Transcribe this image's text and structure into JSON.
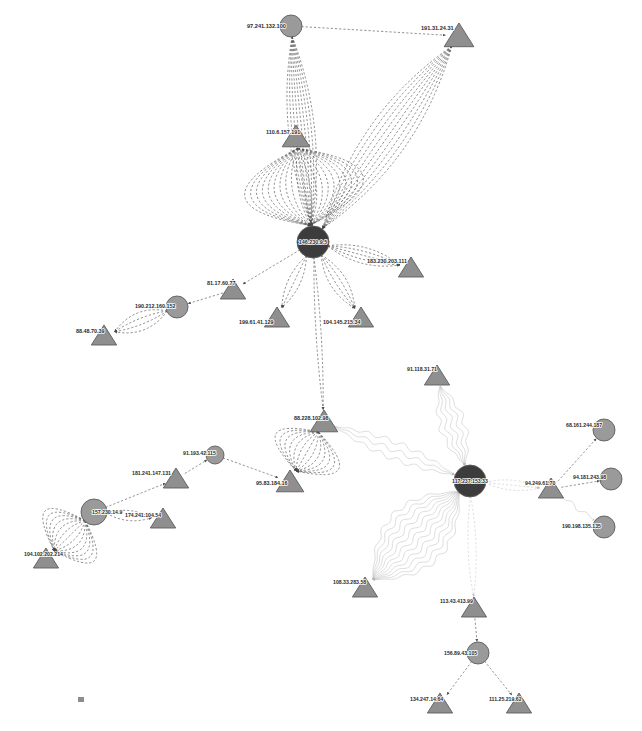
{
  "canvas": {
    "width": 642,
    "height": 731,
    "background": "#ffffff"
  },
  "style": {
    "node_fill_circle": "#9a9a9a",
    "node_fill_circle_dark": "#3c3c3c",
    "node_fill_triangle": "#8f8f8f",
    "node_stroke": "#5c5c5c",
    "edge_color_dark": "#4a4a4a",
    "edge_color_light": "#b9b9b9",
    "label_color": "#2a2a2a",
    "label_halo": "#ffffff"
  },
  "graph": {
    "type": "directed-network-graph",
    "node_shapes": {
      "circle": "hub/server node",
      "triangle": "endpoint/client node"
    },
    "edge_styles": {
      "dashed": "standard connection",
      "wavy": "alternate connection"
    },
    "nodes": [
      {
        "id": "n1",
        "label": "97.241.132.100",
        "shape": "circle",
        "x": 291,
        "y": 26,
        "r": 11,
        "dark": false,
        "label_dx": -44,
        "label_dy": 2,
        "label_size": 5.6
      },
      {
        "id": "n2",
        "label": "191.31.24.31",
        "shape": "triangle",
        "x": 459,
        "y": 36,
        "r": 13,
        "label_dx": -38,
        "label_dy": -6,
        "label_size": 5.6
      },
      {
        "id": "n3",
        "label": "110.6.157.191",
        "shape": "triangle",
        "x": 296,
        "y": 137,
        "r": 12,
        "label_dx": -30,
        "label_dy": -3,
        "label_size": 5.4
      },
      {
        "id": "n4",
        "label": "146.230.9.5",
        "shape": "circle",
        "x": 313,
        "y": 242,
        "r": 16,
        "dark": true,
        "label_dx": 0,
        "label_dy": 2,
        "label_size": 5.4
      },
      {
        "id": "n5",
        "label": "81.17.60.77",
        "shape": "triangle",
        "x": 233,
        "y": 290,
        "r": 11,
        "label_dx": -26,
        "label_dy": -5,
        "label_size": 5.4
      },
      {
        "id": "n6",
        "label": "183.230.203.111",
        "shape": "triangle",
        "x": 411,
        "y": 268,
        "r": 11,
        "label_dx": -44,
        "label_dy": -5,
        "label_size": 5.4
      },
      {
        "id": "n7",
        "label": "199.61.41.129",
        "shape": "triangle",
        "x": 277,
        "y": 318,
        "r": 11,
        "label_dx": -38,
        "label_dy": 6,
        "label_size": 5.4
      },
      {
        "id": "n8",
        "label": "104.145.215.34",
        "shape": "triangle",
        "x": 361,
        "y": 318,
        "r": 11,
        "label_dx": -38,
        "label_dy": 6,
        "label_size": 5.4
      },
      {
        "id": "n9",
        "label": "190.212.160.152",
        "shape": "circle",
        "x": 177,
        "y": 307,
        "r": 11,
        "dark": false,
        "label_dx": -42,
        "label_dy": 1,
        "label_size": 5.4
      },
      {
        "id": "n10",
        "label": "88.48.70.39",
        "shape": "triangle",
        "x": 104,
        "y": 336,
        "r": 11,
        "label_dx": -28,
        "label_dy": -3,
        "label_size": 5.4
      },
      {
        "id": "n11",
        "label": "88.228.102.98",
        "shape": "triangle",
        "x": 324,
        "y": 422,
        "r": 12,
        "label_dx": -30,
        "label_dy": -2,
        "label_size": 5.4
      },
      {
        "id": "n12",
        "label": "95.83.184.16",
        "shape": "triangle",
        "x": 290,
        "y": 482,
        "r": 12,
        "label_dx": -34,
        "label_dy": 3,
        "label_size": 5.4
      },
      {
        "id": "n13",
        "label": "91.193.42.115",
        "shape": "circle",
        "x": 215,
        "y": 455,
        "r": 9,
        "dark": false,
        "label_dx": -32,
        "label_dy": 0,
        "label_size": 5.2
      },
      {
        "id": "n14",
        "label": "181.241.147.131",
        "shape": "triangle",
        "x": 176,
        "y": 479,
        "r": 11,
        "label_dx": -44,
        "label_dy": -4,
        "label_size": 5.2
      },
      {
        "id": "n15",
        "label": "157.230.14.9",
        "shape": "circle",
        "x": 94,
        "y": 512,
        "r": 13,
        "dark": false,
        "label_dx": -2,
        "label_dy": 2,
        "label_size": 5.2
      },
      {
        "id": "n16",
        "label": "174.241.104.54",
        "shape": "triangle",
        "x": 163,
        "y": 519,
        "r": 11,
        "label_dx": -38,
        "label_dy": -2,
        "label_size": 5.2
      },
      {
        "id": "n17",
        "label": "104.102.202.214",
        "shape": "triangle",
        "x": 46,
        "y": 559,
        "r": 11,
        "label_dx": -22,
        "label_dy": -3,
        "label_size": 5.2
      },
      {
        "id": "n18",
        "label": "117.237.153.33",
        "shape": "circle",
        "x": 470,
        "y": 481,
        "r": 16,
        "dark": true,
        "label_dx": 0,
        "label_dy": 2,
        "label_size": 5.2
      },
      {
        "id": "n19",
        "label": "91.118.31.71",
        "shape": "triangle",
        "x": 437,
        "y": 376,
        "r": 11,
        "label_dx": -30,
        "label_dy": -5,
        "label_size": 5.2
      },
      {
        "id": "n20",
        "label": "94.249.61.70",
        "shape": "triangle",
        "x": 551,
        "y": 489,
        "r": 11,
        "label_dx": -26,
        "label_dy": -4,
        "label_size": 5.2
      },
      {
        "id": "n21",
        "label": "68.161.244.187",
        "shape": "circle",
        "x": 604,
        "y": 430,
        "r": 11,
        "dark": false,
        "label_dx": -38,
        "label_dy": -3,
        "label_size": 5.2
      },
      {
        "id": "n22",
        "label": "94.181.243.98",
        "shape": "circle",
        "x": 611,
        "y": 479,
        "r": 11,
        "dark": false,
        "label_dx": -38,
        "label_dy": 0,
        "label_size": 5.2
      },
      {
        "id": "n23",
        "label": "190.198.135.135",
        "shape": "circle",
        "x": 604,
        "y": 527,
        "r": 11,
        "dark": false,
        "label_dx": -42,
        "label_dy": 1,
        "label_size": 5.2
      },
      {
        "id": "n24",
        "label": "108.33.283.58",
        "shape": "triangle",
        "x": 365,
        "y": 588,
        "r": 11,
        "label_dx": -32,
        "label_dy": -4,
        "label_size": 5.2
      },
      {
        "id": "n25",
        "label": "113.43.413.99",
        "shape": "triangle",
        "x": 474,
        "y": 608,
        "r": 11,
        "label_dx": -34,
        "label_dy": -5,
        "label_size": 5.2
      },
      {
        "id": "n26",
        "label": "156.89.43.105",
        "shape": "circle",
        "x": 478,
        "y": 653,
        "r": 11,
        "dark": false,
        "label_dx": -34,
        "label_dy": 2,
        "label_size": 5.2
      },
      {
        "id": "n27",
        "label": "134.247.14.64",
        "shape": "triangle",
        "x": 440,
        "y": 704,
        "r": 11,
        "label_dx": -30,
        "label_dy": -3,
        "label_size": 5.2
      },
      {
        "id": "n28",
        "label": "111.25.219.62",
        "shape": "triangle",
        "x": 519,
        "y": 704,
        "r": 11,
        "label_dx": -30,
        "label_dy": -3,
        "label_size": 5.2
      }
    ],
    "edges": [
      {
        "source": "n1",
        "target": "n2",
        "style": "dashed",
        "tone": "dark",
        "bundle": 1,
        "spread": 0
      },
      {
        "source": "n1",
        "target": "n4",
        "style": "dashed",
        "tone": "dark",
        "bundle": 9,
        "spread": 26
      },
      {
        "source": "n2",
        "target": "n4",
        "style": "dashed",
        "tone": "dark",
        "bundle": 9,
        "spread": 40
      },
      {
        "source": "n3",
        "target": "n4",
        "style": "dashed",
        "tone": "dark",
        "bundle": 21,
        "spread": 120
      },
      {
        "source": "n4",
        "target": "n5",
        "style": "dashed",
        "tone": "dark",
        "bundle": 1,
        "spread": 0
      },
      {
        "source": "n4",
        "target": "n6",
        "style": "dashed",
        "tone": "dark",
        "bundle": 5,
        "spread": 16
      },
      {
        "source": "n4",
        "target": "n7",
        "style": "dashed",
        "tone": "dark",
        "bundle": 3,
        "spread": 12
      },
      {
        "source": "n4",
        "target": "n8",
        "style": "dashed",
        "tone": "dark",
        "bundle": 4,
        "spread": 16
      },
      {
        "source": "n4",
        "target": "n11",
        "style": "dashed",
        "tone": "dark",
        "bundle": 2,
        "spread": 5
      },
      {
        "source": "n5",
        "target": "n9",
        "style": "dashed",
        "tone": "dark",
        "bundle": 1,
        "spread": 0
      },
      {
        "source": "n9",
        "target": "n10",
        "style": "dashed",
        "tone": "dark",
        "bundle": 4,
        "spread": 18
      },
      {
        "source": "n11",
        "target": "n12",
        "style": "dashed",
        "tone": "dark",
        "bundle": 13,
        "spread": 72
      },
      {
        "source": "n13",
        "target": "n12",
        "style": "dashed",
        "tone": "dark",
        "bundle": 1,
        "spread": 0
      },
      {
        "source": "n14",
        "target": "n13",
        "style": "dashed",
        "tone": "dark",
        "bundle": 1,
        "spread": 0
      },
      {
        "source": "n15",
        "target": "n14",
        "style": "dashed",
        "tone": "dark",
        "bundle": 1,
        "spread": 0
      },
      {
        "source": "n15",
        "target": "n16",
        "style": "dashed",
        "tone": "dark",
        "bundle": 2,
        "spread": 10
      },
      {
        "source": "n15",
        "target": "n17",
        "style": "dashed",
        "tone": "dark",
        "bundle": 13,
        "spread": 70
      },
      {
        "source": "n11",
        "target": "n18",
        "style": "wavy",
        "tone": "light",
        "bundle": 3,
        "spread": 16
      },
      {
        "source": "n19",
        "target": "n18",
        "style": "wavy",
        "tone": "light",
        "bundle": 5,
        "spread": 24
      },
      {
        "source": "n18",
        "target": "n20",
        "style": "dashed",
        "tone": "light",
        "bundle": 3,
        "spread": 10
      },
      {
        "source": "n20",
        "target": "n21",
        "style": "dashed",
        "tone": "dark",
        "bundle": 1,
        "spread": 0
      },
      {
        "source": "n20",
        "target": "n22",
        "style": "dashed",
        "tone": "dark",
        "bundle": 1,
        "spread": 0
      },
      {
        "source": "n20",
        "target": "n23",
        "style": "wavy",
        "tone": "light",
        "bundle": 1,
        "spread": 0
      },
      {
        "source": "n18",
        "target": "n24",
        "style": "wavy",
        "tone": "light",
        "bundle": 11,
        "spread": 62
      },
      {
        "source": "n18",
        "target": "n25",
        "style": "dashed",
        "tone": "light",
        "bundle": 2,
        "spread": 8
      },
      {
        "source": "n25",
        "target": "n26",
        "style": "dashed",
        "tone": "dark",
        "bundle": 1,
        "spread": 0
      },
      {
        "source": "n26",
        "target": "n27",
        "style": "dashed",
        "tone": "dark",
        "bundle": 1,
        "spread": 0
      },
      {
        "source": "n26",
        "target": "n28",
        "style": "dashed",
        "tone": "dark",
        "bundle": 1,
        "spread": 0
      }
    ]
  },
  "artifact": {
    "present": true,
    "x": 78,
    "y": 697,
    "width": 6,
    "height": 5
  }
}
